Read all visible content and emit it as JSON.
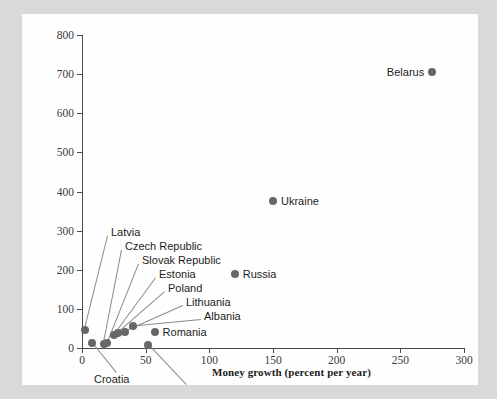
{
  "chart_data": {
    "type": "scatter",
    "title": "",
    "xlabel": "Money growth (percent per year)",
    "ylabel": "Inflation rate (percent per year)",
    "xlim": [
      0,
      300
    ],
    "ylim": [
      0,
      800
    ],
    "xticks": [
      0,
      50,
      100,
      150,
      200,
      250,
      300
    ],
    "yticks": [
      0,
      100,
      200,
      300,
      400,
      500,
      600,
      700,
      800
    ],
    "grid": false,
    "legend": "none",
    "marker_color": "#676767",
    "axis_color": "#4a4a4a",
    "points": [
      {
        "name": "Belarus",
        "x": 275,
        "y": 705,
        "label_side": "left"
      },
      {
        "name": "Ukraine",
        "x": 150,
        "y": 375,
        "label_side": "right"
      },
      {
        "name": "Russia",
        "x": 120,
        "y": 190,
        "label_side": "right"
      },
      {
        "name": "Romania",
        "x": 57,
        "y": 40,
        "label_side": "right"
      },
      {
        "name": "Albania",
        "x": 40,
        "y": 55,
        "label_side": "callout-top"
      },
      {
        "name": "Lithuania",
        "x": 34,
        "y": 42,
        "label_side": "callout-top"
      },
      {
        "name": "Poland",
        "x": 28,
        "y": 38,
        "label_side": "callout-top"
      },
      {
        "name": "Estonia",
        "x": 25,
        "y": 32,
        "label_side": "callout-top"
      },
      {
        "name": "Slovak Republic",
        "x": 20,
        "y": 12,
        "label_side": "callout-top"
      },
      {
        "name": "Czech Republic",
        "x": 17,
        "y": 10,
        "label_side": "callout-top"
      },
      {
        "name": "Latvia",
        "x": 2,
        "y": 45,
        "label_side": "callout-top"
      },
      {
        "name": "Croatia",
        "x": 8,
        "y": 12,
        "label_side": "callout-bottom"
      },
      {
        "name": "Slovenia",
        "x": 52,
        "y": 8,
        "label_side": "callout-bottom"
      }
    ],
    "callouts_top": [
      "Latvia",
      "Czech Republic",
      "Slovak Republic",
      "Estonia",
      "Poland",
      "Lithuania",
      "Albania"
    ],
    "callouts_bottom": [
      "Croatia",
      "Slovenia"
    ]
  },
  "axes": {
    "y_title_line1": "Inflation rate",
    "y_title_line2": "(percent per year)",
    "x_title": "Money growth (percent per year)"
  }
}
